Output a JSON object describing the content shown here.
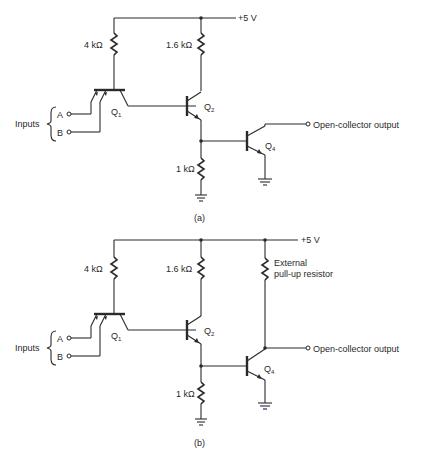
{
  "figure": {
    "panels": [
      {
        "id": "a",
        "caption": "(a)",
        "supply_label": "+5 V",
        "resistors": {
          "r1": "4 kΩ",
          "r2": "1.6 kΩ",
          "r3": "1 kΩ"
        },
        "transistors": {
          "q1": "Q",
          "q1_sub": "1",
          "q2": "Q",
          "q2_sub": "2",
          "q4": "Q",
          "q4_sub": "4"
        },
        "inputs_label": "Inputs",
        "input_a": "A",
        "input_b": "B",
        "output_label": "Open-collector output"
      },
      {
        "id": "b",
        "caption": "(b)",
        "supply_label": "+5 V",
        "resistors": {
          "r1": "4 kΩ",
          "r2": "1.6 kΩ",
          "r3": "1 kΩ"
        },
        "pullup_label_line1": "External",
        "pullup_label_line2": "pull-up resistor",
        "transistors": {
          "q1": "Q",
          "q1_sub": "1",
          "q2": "Q",
          "q2_sub": "2",
          "q4": "Q",
          "q4_sub": "4"
        },
        "inputs_label": "Inputs",
        "input_a": "A",
        "input_b": "B",
        "output_label": "Open-collector output"
      }
    ]
  }
}
